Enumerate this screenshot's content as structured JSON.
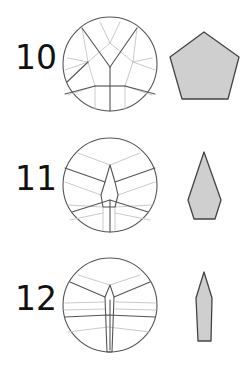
{
  "colors": {
    "background": "#ffffff",
    "dark_line": "#555555",
    "light_line": "#c4c4c4",
    "shape_fill": "#cfcfcf",
    "shape_stroke": "#444444",
    "text": "#111111"
  },
  "steps": [
    {
      "label": "10",
      "label_pos": [
        15,
        69
      ],
      "circle": {
        "cx": 110,
        "cy": 64,
        "r": 47
      },
      "dark_lines": [
        [
          [
            110,
            67
          ],
          [
            82,
            28
          ]
        ],
        [
          [
            110,
            67
          ],
          [
            137,
            28
          ]
        ],
        [
          [
            110,
            67
          ],
          [
            110,
            111
          ]
        ],
        [
          [
            95,
            86
          ],
          [
            65,
            94
          ]
        ],
        [
          [
            125,
            86
          ],
          [
            155,
            94
          ]
        ],
        [
          [
            95,
            86
          ],
          [
            125,
            86
          ]
        ],
        [
          [
            88,
            62
          ],
          [
            67,
            82
          ]
        ]
      ],
      "light_lines": [
        [
          [
            110,
            43
          ],
          [
            88,
            62
          ],
          [
            95,
            86
          ],
          [
            125,
            86
          ],
          [
            133,
            62
          ],
          [
            110,
            43
          ]
        ],
        [
          [
            110,
            43
          ],
          [
            100,
            22
          ]
        ],
        [
          [
            110,
            43
          ],
          [
            120,
            22
          ]
        ],
        [
          [
            88,
            62
          ],
          [
            68,
            58
          ]
        ],
        [
          [
            133,
            62
          ],
          [
            152,
            58
          ]
        ],
        [
          [
            88,
            62
          ],
          [
            65,
            70
          ]
        ],
        [
          [
            133,
            62
          ],
          [
            155,
            70
          ]
        ],
        [
          [
            95,
            86
          ],
          [
            95,
            109
          ]
        ],
        [
          [
            125,
            86
          ],
          [
            125,
            109
          ]
        ],
        [
          [
            68,
            95
          ],
          [
            95,
            86
          ]
        ],
        [
          [
            152,
            95
          ],
          [
            125,
            86
          ]
        ],
        [
          [
            82,
            28
          ],
          [
            88,
            62
          ]
        ],
        [
          [
            137,
            28
          ],
          [
            133,
            62
          ]
        ]
      ],
      "shape": [
        [
          204,
          32
        ],
        [
          239,
          57
        ],
        [
          228,
          99
        ],
        [
          182,
          99
        ],
        [
          170,
          57
        ]
      ]
    },
    {
      "label": "11",
      "label_pos": [
        15,
        190
      ],
      "circle": {
        "cx": 110,
        "cy": 185,
        "r": 47
      },
      "dark_lines": [
        [
          [
            65,
            168
          ],
          [
            105,
            182
          ]
        ],
        [
          [
            115,
            182
          ],
          [
            155,
            168
          ]
        ],
        [
          [
            72,
            212
          ],
          [
            110,
            200
          ],
          [
            148,
            212
          ]
        ],
        [
          [
            110,
            200
          ],
          [
            110,
            232
          ]
        ],
        [
          [
            110,
            165
          ],
          [
            105,
            182
          ],
          [
            101,
            195
          ],
          [
            103,
            207
          ],
          [
            115,
            207
          ],
          [
            118,
            195
          ],
          [
            115,
            182
          ],
          [
            110,
            165
          ]
        ]
      ],
      "light_lines": [
        [
          [
            110,
            165
          ],
          [
            78,
            153
          ]
        ],
        [
          [
            110,
            165
          ],
          [
            140,
            153
          ]
        ],
        [
          [
            65,
            182
          ],
          [
            101,
            195
          ]
        ],
        [
          [
            155,
            182
          ],
          [
            118,
            195
          ]
        ],
        [
          [
            68,
            205
          ],
          [
            103,
            207
          ]
        ],
        [
          [
            152,
            205
          ],
          [
            115,
            207
          ]
        ],
        [
          [
            70,
            220
          ],
          [
            103,
            213
          ]
        ],
        [
          [
            150,
            220
          ],
          [
            115,
            213
          ]
        ],
        [
          [
            103,
            207
          ],
          [
            103,
            230
          ]
        ],
        [
          [
            115,
            207
          ],
          [
            115,
            230
          ]
        ]
      ],
      "shape": [
        [
          204,
          152
        ],
        [
          221,
          200
        ],
        [
          215,
          219
        ],
        [
          194,
          219
        ],
        [
          188,
          200
        ]
      ]
    },
    {
      "label": "12",
      "label_pos": [
        15,
        310
      ],
      "circle": {
        "cx": 110,
        "cy": 305,
        "r": 47
      },
      "dark_lines": [
        [
          [
            70,
            282
          ],
          [
            105,
            297
          ]
        ],
        [
          [
            114,
            297
          ],
          [
            150,
            282
          ]
        ],
        [
          [
            65,
            317
          ],
          [
            108,
            315
          ],
          [
            155,
            317
          ]
        ],
        [
          [
            110,
            285
          ],
          [
            105,
            297
          ],
          [
            107,
            352
          ],
          [
            112,
            352
          ],
          [
            114,
            297
          ],
          [
            110,
            285
          ]
        ],
        [
          [
            110,
            300
          ],
          [
            110,
            350
          ]
        ]
      ],
      "light_lines": [
        [
          [
            110,
            285
          ],
          [
            78,
            275
          ]
        ],
        [
          [
            110,
            285
          ],
          [
            140,
            275
          ]
        ],
        [
          [
            65,
            303
          ],
          [
            104,
            302
          ]
        ],
        [
          [
            155,
            303
          ],
          [
            116,
            302
          ]
        ],
        [
          [
            68,
            332
          ],
          [
            108,
            327
          ],
          [
            150,
            332
          ]
        ],
        [
          [
            64,
            310
          ],
          [
            105,
            309
          ]
        ],
        [
          [
            156,
            310
          ],
          [
            115,
            309
          ]
        ]
      ],
      "shape": [
        [
          204,
          272
        ],
        [
          212,
          298
        ],
        [
          211,
          341
        ],
        [
          198,
          341
        ],
        [
          196,
          298
        ]
      ]
    }
  ]
}
